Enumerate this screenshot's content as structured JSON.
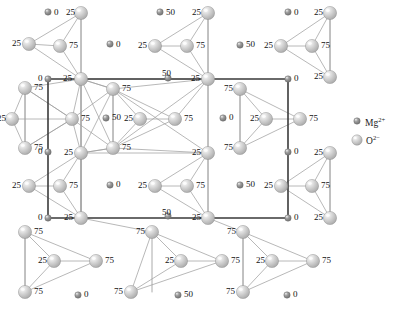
{
  "figure": {
    "type": "crystal-structure-diagram",
    "width": 411,
    "height": 312,
    "background": "#ffffff"
  },
  "unit_cell": {
    "x": 48,
    "y": 79,
    "width": 240,
    "height": 139,
    "stroke": "#3a3a3a",
    "stroke_width": 1.6
  },
  "colors": {
    "oxygen_fill": "#c9c9c9",
    "oxygen_highlight": "#f2f2f2",
    "oxygen_stroke": "#8f8f8f",
    "magnesium_fill": "#8c8c8c",
    "magnesium_highlight": "#d5d5d5",
    "magnesium_stroke": "#6b6b6b",
    "bond_stroke": "#a0a0a0",
    "cell_stroke": "#3a3a3a",
    "label_color": "#111111"
  },
  "legend": {
    "title": "",
    "items": [
      {
        "id": "mg",
        "species": "Mg",
        "charge": "2+",
        "label": "Mg",
        "sup": "2+",
        "icon": "small-sphere-icon",
        "r": 3.2,
        "cx": 357,
        "cy": 121,
        "text_x": 365,
        "text_y": 117
      },
      {
        "id": "o",
        "species": "O",
        "charge": "2−",
        "label": "O",
        "sup": "2−",
        "icon": "large-sphere-icon",
        "r": 5.2,
        "cx": 357,
        "cy": 140,
        "text_x": 366,
        "text_y": 135
      }
    ]
  },
  "atoms": [
    {
      "id": "a1",
      "kind": "Mg",
      "cx": 48,
      "cy": 12,
      "r": 3.2,
      "label": "0",
      "lx": 54,
      "ly": 8
    },
    {
      "id": "a2",
      "kind": "O",
      "cx": 81,
      "cy": 13,
      "r": 6.6,
      "label": "25",
      "lx": 66,
      "ly": 8
    },
    {
      "id": "a3",
      "kind": "O",
      "cx": 29,
      "cy": 44,
      "r": 6.6,
      "label": "25",
      "lx": 12,
      "ly": 39
    },
    {
      "id": "a4",
      "kind": "O",
      "cx": 60,
      "cy": 46,
      "r": 6.6,
      "label": "75",
      "lx": 69,
      "ly": 41
    },
    {
      "id": "a5",
      "kind": "Mg",
      "cx": 110,
      "cy": 44,
      "r": 3.2,
      "label": "0",
      "lx": 116,
      "ly": 40
    },
    {
      "id": "a6",
      "kind": "Mg",
      "cx": 160,
      "cy": 12,
      "r": 3.2,
      "label": "50",
      "lx": 166,
      "ly": 8
    },
    {
      "id": "a7",
      "kind": "O",
      "cx": 208,
      "cy": 13,
      "r": 6.6,
      "label": "25",
      "lx": 192,
      "ly": 8
    },
    {
      "id": "a8",
      "kind": "O",
      "cx": 155,
      "cy": 46,
      "r": 6.6,
      "label": "25",
      "lx": 138,
      "ly": 41
    },
    {
      "id": "a9",
      "kind": "O",
      "cx": 187,
      "cy": 46,
      "r": 6.6,
      "label": "75",
      "lx": 196,
      "ly": 41
    },
    {
      "id": "a10",
      "kind": "Mg",
      "cx": 240,
      "cy": 45,
      "r": 3.2,
      "label": "50",
      "lx": 246,
      "ly": 40
    },
    {
      "id": "a11",
      "kind": "Mg",
      "cx": 288,
      "cy": 12,
      "r": 3.2,
      "label": "0",
      "lx": 294,
      "ly": 8
    },
    {
      "id": "a12",
      "kind": "O",
      "cx": 330,
      "cy": 13,
      "r": 6.6,
      "label": "25",
      "lx": 314,
      "ly": 8
    },
    {
      "id": "a13",
      "kind": "O",
      "cx": 281,
      "cy": 46,
      "r": 6.6,
      "label": "25",
      "lx": 264,
      "ly": 41
    },
    {
      "id": "a14",
      "kind": "O",
      "cx": 312,
      "cy": 46,
      "r": 6.6,
      "label": "75",
      "lx": 321,
      "ly": 41
    },
    {
      "id": "a15",
      "kind": "O",
      "cx": 330,
      "cy": 77,
      "r": 6.6,
      "label": "25",
      "lx": 314,
      "ly": 72
    },
    {
      "id": "b1",
      "kind": "O",
      "cx": 81,
      "cy": 79,
      "r": 6.6,
      "label": "25",
      "lx": 63,
      "ly": 74
    },
    {
      "id": "b2",
      "kind": "Mg",
      "cx": 48,
      "cy": 79,
      "r": 3.2,
      "label": "0",
      "lx": 38,
      "ly": 74
    },
    {
      "id": "b3",
      "kind": "Mg",
      "cx": 168,
      "cy": 78,
      "r": 3.2,
      "label": "50",
      "lx": 162,
      "ly": 69
    },
    {
      "id": "b4",
      "kind": "O",
      "cx": 208,
      "cy": 79,
      "r": 6.6,
      "label": "25",
      "lx": 191,
      "ly": 74
    },
    {
      "id": "b5",
      "kind": "Mg",
      "cx": 288,
      "cy": 79,
      "r": 3.2,
      "label": "0",
      "lx": 294,
      "ly": 74
    },
    {
      "id": "c1",
      "kind": "O",
      "cx": 25,
      "cy": 88,
      "r": 6.6,
      "label": "75",
      "lx": 34,
      "ly": 83
    },
    {
      "id": "c2",
      "kind": "O",
      "cx": 113,
      "cy": 89,
      "r": 6.6,
      "label": "75",
      "lx": 122,
      "ly": 84
    },
    {
      "id": "c3",
      "kind": "O",
      "cx": 240,
      "cy": 89,
      "r": 6.6,
      "label": "75",
      "lx": 224,
      "ly": 84
    },
    {
      "id": "d1",
      "kind": "O",
      "cx": 12,
      "cy": 119,
      "r": 6.6,
      "label": "25",
      "lx": -3,
      "ly": 114
    },
    {
      "id": "d2",
      "kind": "O",
      "cx": 72,
      "cy": 119,
      "r": 6.6,
      "label": "75",
      "lx": 81,
      "ly": 114
    },
    {
      "id": "d3",
      "kind": "Mg",
      "cx": 106,
      "cy": 118,
      "r": 3.2,
      "label": "50",
      "lx": 112,
      "ly": 113
    },
    {
      "id": "d4",
      "kind": "O",
      "cx": 140,
      "cy": 119,
      "r": 6.6,
      "label": "25",
      "lx": 124,
      "ly": 114
    },
    {
      "id": "d5",
      "kind": "O",
      "cx": 175,
      "cy": 119,
      "r": 6.6,
      "label": "75",
      "lx": 184,
      "ly": 114
    },
    {
      "id": "d6",
      "kind": "Mg",
      "cx": 223,
      "cy": 118,
      "r": 3.2,
      "label": "0",
      "lx": 229,
      "ly": 113
    },
    {
      "id": "d7",
      "kind": "O",
      "cx": 266,
      "cy": 119,
      "r": 6.6,
      "label": "25",
      "lx": 250,
      "ly": 114
    },
    {
      "id": "d8",
      "kind": "O",
      "cx": 300,
      "cy": 119,
      "r": 6.6,
      "label": "75",
      "lx": 309,
      "ly": 114
    },
    {
      "id": "e1",
      "kind": "O",
      "cx": 25,
      "cy": 148,
      "r": 6.6,
      "label": "75",
      "lx": 34,
      "ly": 143
    },
    {
      "id": "e2",
      "kind": "O",
      "cx": 113,
      "cy": 148,
      "r": 6.6,
      "label": "75",
      "lx": 122,
      "ly": 143
    },
    {
      "id": "e3",
      "kind": "Mg",
      "cx": 48,
      "cy": 152,
      "r": 3.2,
      "label": "0",
      "lx": 38,
      "ly": 147
    },
    {
      "id": "e4",
      "kind": "O",
      "cx": 240,
      "cy": 148,
      "r": 6.6,
      "label": "75",
      "lx": 224,
      "ly": 143
    },
    {
      "id": "e5",
      "kind": "Mg",
      "cx": 288,
      "cy": 152,
      "r": 3.2,
      "label": "0",
      "lx": 294,
      "ly": 147
    },
    {
      "id": "f1",
      "kind": "O",
      "cx": 81,
      "cy": 153,
      "r": 6.6,
      "label": "25",
      "lx": 64,
      "ly": 148
    },
    {
      "id": "f2",
      "kind": "O",
      "cx": 208,
      "cy": 153,
      "r": 6.6,
      "label": "25",
      "lx": 192,
      "ly": 148
    },
    {
      "id": "f3",
      "kind": "O",
      "cx": 330,
      "cy": 153,
      "r": 6.6,
      "label": "25",
      "lx": 314,
      "ly": 148
    },
    {
      "id": "g1",
      "kind": "O",
      "cx": 60,
      "cy": 186,
      "r": 6.6,
      "label": "75",
      "lx": 69,
      "ly": 181
    },
    {
      "id": "g2",
      "kind": "O",
      "cx": 29,
      "cy": 186,
      "r": 6.6,
      "label": "25",
      "lx": 12,
      "ly": 181
    },
    {
      "id": "g3",
      "kind": "Mg",
      "cx": 110,
      "cy": 185,
      "r": 3.2,
      "label": "0",
      "lx": 116,
      "ly": 180
    },
    {
      "id": "g4",
      "kind": "O",
      "cx": 155,
      "cy": 186,
      "r": 6.6,
      "label": "25",
      "lx": 138,
      "ly": 181
    },
    {
      "id": "g5",
      "kind": "O",
      "cx": 187,
      "cy": 186,
      "r": 6.6,
      "label": "75",
      "lx": 196,
      "ly": 181
    },
    {
      "id": "g6",
      "kind": "Mg",
      "cx": 240,
      "cy": 185,
      "r": 3.2,
      "label": "50",
      "lx": 246,
      "ly": 180
    },
    {
      "id": "g7",
      "kind": "O",
      "cx": 281,
      "cy": 186,
      "r": 6.6,
      "label": "25",
      "lx": 264,
      "ly": 181
    },
    {
      "id": "g8",
      "kind": "O",
      "cx": 312,
      "cy": 186,
      "r": 6.6,
      "label": "75",
      "lx": 321,
      "ly": 181
    },
    {
      "id": "h1",
      "kind": "O",
      "cx": 81,
      "cy": 218,
      "r": 6.6,
      "label": "25",
      "lx": 64,
      "ly": 213
    },
    {
      "id": "h2",
      "kind": "Mg",
      "cx": 48,
      "cy": 218,
      "r": 3.2,
      "label": "0",
      "lx": 38,
      "ly": 213
    },
    {
      "id": "h3",
      "kind": "Mg",
      "cx": 168,
      "cy": 216,
      "r": 3.2,
      "label": "50",
      "lx": 162,
      "ly": 208
    },
    {
      "id": "h4",
      "kind": "O",
      "cx": 208,
      "cy": 218,
      "r": 6.6,
      "label": "25",
      "lx": 192,
      "ly": 213
    },
    {
      "id": "h5",
      "kind": "Mg",
      "cx": 288,
      "cy": 218,
      "r": 3.2,
      "label": "0",
      "lx": 294,
      "ly": 213
    },
    {
      "id": "h6",
      "kind": "O",
      "cx": 330,
      "cy": 218,
      "r": 6.6,
      "label": "25",
      "lx": 314,
      "ly": 213
    },
    {
      "id": "i1",
      "kind": "O",
      "cx": 25,
      "cy": 232,
      "r": 6.6,
      "label": "75",
      "lx": 34,
      "ly": 227
    },
    {
      "id": "i2",
      "kind": "O",
      "cx": 152,
      "cy": 232,
      "r": 6.6,
      "label": "75",
      "lx": 136,
      "ly": 227
    },
    {
      "id": "i3",
      "kind": "O",
      "cx": 243,
      "cy": 232,
      "r": 6.6,
      "label": "75",
      "lx": 227,
      "ly": 227
    },
    {
      "id": "j1",
      "kind": "O",
      "cx": 54,
      "cy": 261,
      "r": 6.6,
      "label": "25",
      "lx": 38,
      "ly": 256
    },
    {
      "id": "j2",
      "kind": "O",
      "cx": 96,
      "cy": 261,
      "r": 6.6,
      "label": "75",
      "lx": 105,
      "ly": 256
    },
    {
      "id": "j3",
      "kind": "O",
      "cx": 181,
      "cy": 261,
      "r": 6.6,
      "label": "25",
      "lx": 165,
      "ly": 256
    },
    {
      "id": "j4",
      "kind": "O",
      "cx": 222,
      "cy": 261,
      "r": 6.6,
      "label": "75",
      "lx": 231,
      "ly": 256
    },
    {
      "id": "j5",
      "kind": "O",
      "cx": 272,
      "cy": 261,
      "r": 6.6,
      "label": "25",
      "lx": 256,
      "ly": 256
    },
    {
      "id": "j6",
      "kind": "O",
      "cx": 313,
      "cy": 261,
      "r": 6.6,
      "label": "75",
      "lx": 322,
      "ly": 256
    },
    {
      "id": "k1",
      "kind": "O",
      "cx": 25,
      "cy": 292,
      "r": 6.6,
      "label": "75",
      "lx": 34,
      "ly": 287
    },
    {
      "id": "k2",
      "kind": "Mg",
      "cx": 78,
      "cy": 295,
      "r": 3.2,
      "label": "0",
      "lx": 84,
      "ly": 290
    },
    {
      "id": "k3",
      "kind": "O",
      "cx": 131,
      "cy": 292,
      "r": 6.6,
      "label": "75",
      "lx": 114,
      "ly": 287
    },
    {
      "id": "k4",
      "kind": "Mg",
      "cx": 178,
      "cy": 295,
      "r": 3.2,
      "label": "50",
      "lx": 184,
      "ly": 290
    },
    {
      "id": "k5",
      "kind": "O",
      "cx": 243,
      "cy": 292,
      "r": 6.6,
      "label": "75",
      "lx": 226,
      "ly": 287
    },
    {
      "id": "k6",
      "kind": "Mg",
      "cx": 287,
      "cy": 295,
      "r": 3.2,
      "label": "0",
      "lx": 293,
      "ly": 290
    }
  ],
  "bonds": [
    [
      "a2",
      "a3"
    ],
    [
      "a2",
      "a4"
    ],
    [
      "a3",
      "a4"
    ],
    [
      "a2",
      "a15x"
    ],
    [
      "a3",
      "b1"
    ],
    [
      "a4",
      "b1"
    ],
    [
      "a2",
      "b1"
    ],
    [
      "a7",
      "a8"
    ],
    [
      "a7",
      "a9"
    ],
    [
      "a8",
      "a9"
    ],
    [
      "a8",
      "b4"
    ],
    [
      "a9",
      "b4"
    ],
    [
      "a7",
      "b4"
    ],
    [
      "a12",
      "a13"
    ],
    [
      "a12",
      "a14"
    ],
    [
      "a13",
      "a14"
    ],
    [
      "a13",
      "a15"
    ],
    [
      "a14",
      "a15"
    ],
    [
      "a12",
      "a15"
    ],
    [
      "c1",
      "d1"
    ],
    [
      "c1",
      "d2"
    ],
    [
      "d1",
      "d2"
    ],
    [
      "c1",
      "e1"
    ],
    [
      "d1",
      "e1"
    ],
    [
      "d2",
      "e1"
    ],
    [
      "c2",
      "d4"
    ],
    [
      "c2",
      "d5"
    ],
    [
      "d4",
      "d5"
    ],
    [
      "c2",
      "e2"
    ],
    [
      "d4",
      "e2"
    ],
    [
      "d5",
      "e2"
    ],
    [
      "c3",
      "d7"
    ],
    [
      "c3",
      "d8"
    ],
    [
      "d7",
      "d8"
    ],
    [
      "c3",
      "e4"
    ],
    [
      "d7",
      "e4"
    ],
    [
      "d8",
      "e4"
    ],
    [
      "b1",
      "c2"
    ],
    [
      "b1",
      "d2"
    ],
    [
      "b1",
      "e2"
    ],
    [
      "b1",
      "c1"
    ],
    [
      "b1",
      "f1"
    ],
    [
      "f1",
      "c2"
    ],
    [
      "f1",
      "d2"
    ],
    [
      "f1",
      "e2"
    ],
    [
      "c2",
      "f2"
    ],
    [
      "c2",
      "b4"
    ],
    [
      "b4",
      "d5"
    ],
    [
      "b4",
      "f2"
    ],
    [
      "e2",
      "f2"
    ],
    [
      "e2",
      "b4"
    ],
    [
      "d2",
      "c2"
    ],
    [
      "d2",
      "e2"
    ],
    [
      "b1",
      "b4"
    ],
    [
      "f1",
      "f2"
    ],
    [
      "c1",
      "d2"
    ],
    [
      "e1",
      "d2"
    ],
    [
      "b1",
      "h1"
    ],
    [
      "f1",
      "h1"
    ],
    [
      "g1",
      "g2"
    ],
    [
      "g1",
      "f1"
    ],
    [
      "g2",
      "f1"
    ],
    [
      "g1",
      "h1"
    ],
    [
      "g2",
      "h1"
    ],
    [
      "f1",
      "h1"
    ],
    [
      "g4",
      "g5"
    ],
    [
      "g4",
      "f2"
    ],
    [
      "g5",
      "f2"
    ],
    [
      "g4",
      "h4"
    ],
    [
      "g5",
      "h4"
    ],
    [
      "f2",
      "h4"
    ],
    [
      "g7",
      "g8"
    ],
    [
      "g7",
      "f3"
    ],
    [
      "g8",
      "f3"
    ],
    [
      "g7",
      "h6"
    ],
    [
      "g8",
      "h6"
    ],
    [
      "f3",
      "h6"
    ],
    [
      "i1",
      "j1"
    ],
    [
      "i1",
      "j2"
    ],
    [
      "j1",
      "j2"
    ],
    [
      "i1",
      "k1"
    ],
    [
      "j1",
      "k1"
    ],
    [
      "j2",
      "k1"
    ],
    [
      "i2",
      "j3"
    ],
    [
      "i2",
      "j4"
    ],
    [
      "j3",
      "j4"
    ],
    [
      "i2",
      "k3"
    ],
    [
      "j3",
      "k3"
    ],
    [
      "j4",
      "k3"
    ],
    [
      "i3",
      "j5"
    ],
    [
      "i3",
      "j6"
    ],
    [
      "j5",
      "j6"
    ],
    [
      "i3",
      "k5"
    ],
    [
      "j5",
      "k5"
    ],
    [
      "j6",
      "k5"
    ],
    [
      "h1",
      "i2"
    ],
    [
      "h4",
      "i3"
    ],
    [
      "b1",
      "c2"
    ],
    [
      "f1",
      "e2"
    ]
  ],
  "cell_edges": [
    {
      "name": "top-edge",
      "x1": 48,
      "y1": 79,
      "x2": 288,
      "y2": 79
    },
    {
      "name": "bottom-edge",
      "x1": 48,
      "y1": 218,
      "x2": 288,
      "y2": 218
    },
    {
      "name": "left-edge",
      "x1": 48,
      "y1": 79,
      "x2": 48,
      "y2": 218
    },
    {
      "name": "right-edge",
      "x1": 288,
      "y1": 79,
      "x2": 288,
      "y2": 218
    }
  ],
  "stem_lines": [
    {
      "name": "stem-a2",
      "x1": 81,
      "y1": 13,
      "x2": 81,
      "y2": 79
    },
    {
      "name": "stem-a7",
      "x1": 208,
      "y1": 13,
      "x2": 208,
      "y2": 79
    },
    {
      "name": "stem-a12",
      "x1": 330,
      "y1": 13,
      "x2": 330,
      "y2": 77
    },
    {
      "name": "stem-c1",
      "x1": 25,
      "y1": 88,
      "x2": 25,
      "y2": 148
    },
    {
      "name": "stem-c2",
      "x1": 113,
      "y1": 89,
      "x2": 113,
      "y2": 148
    },
    {
      "name": "stem-c3",
      "x1": 240,
      "y1": 89,
      "x2": 240,
      "y2": 148
    },
    {
      "name": "stem-i1",
      "x1": 25,
      "y1": 232,
      "x2": 25,
      "y2": 292
    },
    {
      "name": "stem-i2",
      "x1": 152,
      "y1": 232,
      "x2": 152,
      "y2": 292
    },
    {
      "name": "stem-i3",
      "x1": 243,
      "y1": 232,
      "x2": 243,
      "y2": 292
    },
    {
      "name": "stem-f3",
      "x1": 330,
      "y1": 153,
      "x2": 330,
      "y2": 218
    },
    {
      "name": "stem-b1",
      "x1": 81,
      "y1": 79,
      "x2": 81,
      "y2": 153
    },
    {
      "name": "stem-f1",
      "x1": 81,
      "y1": 153,
      "x2": 81,
      "y2": 218
    },
    {
      "name": "stem-b4",
      "x1": 208,
      "y1": 79,
      "x2": 208,
      "y2": 153
    },
    {
      "name": "stem-f2",
      "x1": 208,
      "y1": 153,
      "x2": 208,
      "y2": 218
    }
  ]
}
